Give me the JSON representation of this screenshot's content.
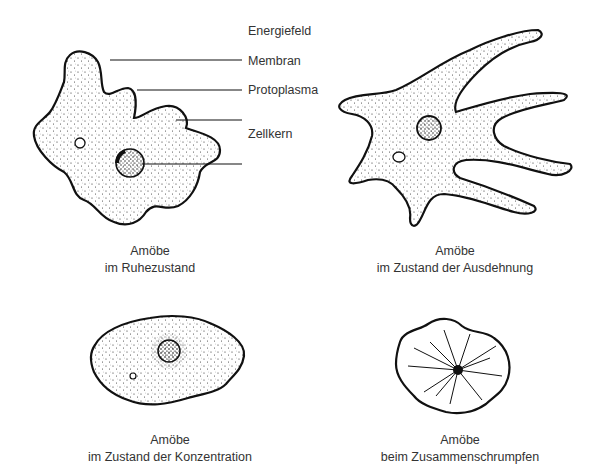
{
  "diagram": {
    "panels": [
      {
        "id": "rest",
        "caption_line1": "Amöbe",
        "caption_line2": "im Ruhezustand",
        "labels": [
          {
            "text": "Energiefeld"
          },
          {
            "text": "Membran"
          },
          {
            "text": "Protoplasma"
          },
          {
            "text": "Zellkern"
          }
        ]
      },
      {
        "id": "expansion",
        "caption_line1": "Amöbe",
        "caption_line2": "im Zustand der Ausdehnung"
      },
      {
        "id": "concentration",
        "caption_line1": "Amöbe",
        "caption_line2": "im Zustand der Konzentration"
      },
      {
        "id": "shrinking",
        "caption_line1": "Amöbe",
        "caption_line2": "beim Zusammenschrumpfen"
      }
    ]
  }
}
